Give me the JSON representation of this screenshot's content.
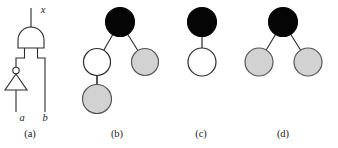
{
  "figure": {
    "panels": [
      {
        "id": "a",
        "caption": "(a)",
        "kind": "logic-circuit"
      },
      {
        "id": "b",
        "caption": "(b)",
        "kind": "node-tree"
      },
      {
        "id": "c",
        "caption": "(c)",
        "kind": "node-tree"
      },
      {
        "id": "d",
        "caption": "(d)",
        "kind": "node-tree"
      }
    ]
  },
  "circuit": {
    "signals": {
      "output": "x",
      "input_a": "a",
      "input_b": "b"
    },
    "gates": [
      {
        "name": "nand-gate",
        "type": "NAND",
        "inputs": [
          "inverter-out",
          "b"
        ],
        "output": "x"
      },
      {
        "name": "inverter-gate",
        "type": "NOT",
        "inputs": [
          "a"
        ],
        "output": "inverter-out"
      }
    ]
  },
  "trees": {
    "b": {
      "nodes": [
        {
          "name": "root",
          "fill": "black"
        },
        {
          "name": "left-child",
          "fill": "white"
        },
        {
          "name": "right-child",
          "fill": "gray"
        },
        {
          "name": "left-grandchild",
          "fill": "gray"
        }
      ],
      "edges": [
        [
          "root",
          "left-child"
        ],
        [
          "root",
          "right-child"
        ],
        [
          "left-child",
          "left-grandchild"
        ]
      ]
    },
    "c": {
      "nodes": [
        {
          "name": "root",
          "fill": "black"
        },
        {
          "name": "child",
          "fill": "white"
        }
      ],
      "edges": [
        [
          "root",
          "child"
        ]
      ]
    },
    "d": {
      "nodes": [
        {
          "name": "root",
          "fill": "black"
        },
        {
          "name": "left-child",
          "fill": "gray"
        },
        {
          "name": "right-child",
          "fill": "gray"
        }
      ],
      "edges": [
        [
          "root",
          "left-child"
        ],
        [
          "root",
          "right-child"
        ]
      ]
    }
  },
  "colors": {
    "stroke": "#2b2b2b",
    "black_node": "#050505",
    "white_node": "#ffffff",
    "gray_node": "#d2d2d2",
    "background": "#ffffff"
  }
}
